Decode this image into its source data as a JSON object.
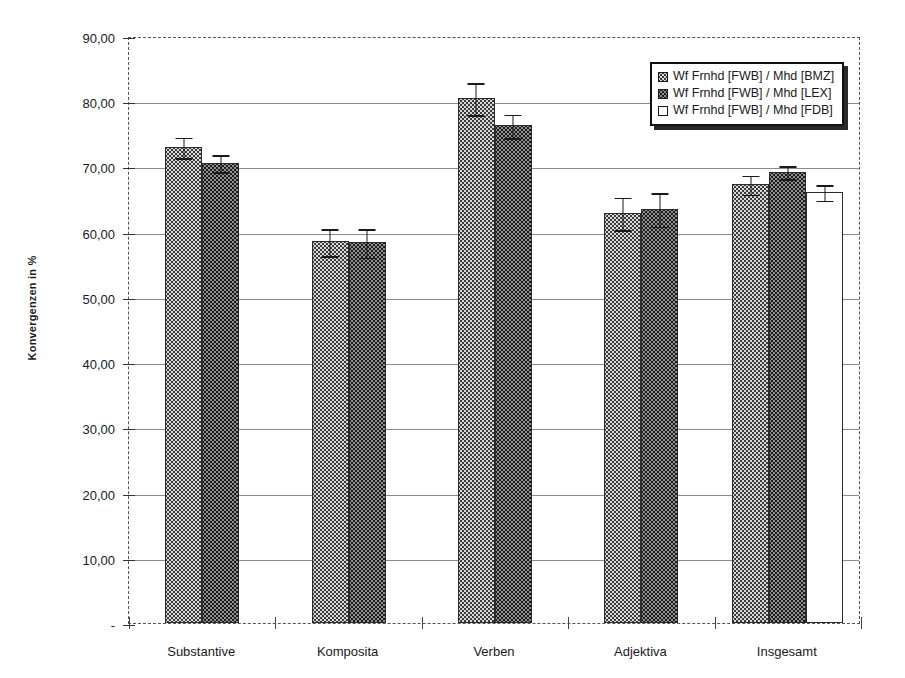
{
  "chart_data": {
    "type": "bar",
    "title": "",
    "xlabel": "",
    "ylabel": "Konvergenzen in %",
    "ylim": [
      0,
      90
    ],
    "yticks": [
      0,
      10,
      20,
      30,
      40,
      50,
      60,
      70,
      80,
      90
    ],
    "ytick_labels": [
      "-",
      "10,00",
      "20,00",
      "30,00",
      "40,00",
      "50,00",
      "60,00",
      "70,00",
      "80,00",
      "90,00"
    ],
    "grid": true,
    "legend_position": "top-right",
    "categories": [
      "Substantive",
      "Komposita",
      "Verben",
      "Adjektiva",
      "Insgesamt"
    ],
    "series": [
      {
        "name": "Wf Frnhd [FWB] / Mhd [BMZ]",
        "swatch": "bmz",
        "values": [
          73.0,
          58.5,
          80.5,
          62.9,
          67.3
        ],
        "errors": [
          1.7,
          2.2,
          2.6,
          2.6,
          1.6
        ]
      },
      {
        "name": "Wf Frnhd [FWB] / Mhd [LEX]",
        "swatch": "lex",
        "values": [
          70.6,
          58.4,
          76.3,
          63.5,
          69.2
        ],
        "errors": [
          1.4,
          2.3,
          1.9,
          2.7,
          1.1
        ]
      },
      {
        "name": "Wf Frnhd [FWB] / Mhd [FDB]",
        "swatch": "fdb",
        "values": [
          null,
          null,
          null,
          null,
          66.1
        ],
        "errors": [
          null,
          null,
          null,
          null,
          1.3
        ]
      }
    ]
  },
  "legend": {
    "items": [
      {
        "label": "Wf Frnhd [FWB] / Mhd [BMZ]",
        "swatch": "bmz"
      },
      {
        "label": "Wf Frnhd [FWB] / Mhd [LEX]",
        "swatch": "lex"
      },
      {
        "label": "Wf Frnhd [FWB] / Mhd [FDB]",
        "swatch": "fdb"
      }
    ]
  },
  "axes": {
    "y_title": "Konvergenzen in %"
  }
}
